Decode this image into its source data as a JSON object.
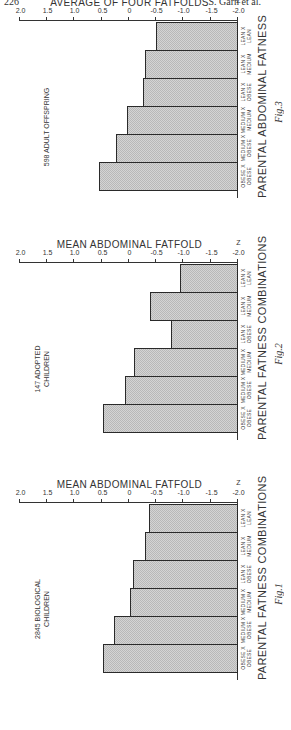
{
  "page": {
    "page_number": "226",
    "running_head": "S. Garn et al."
  },
  "figures": [
    {
      "id": "fig3",
      "caption": "Fig.3",
      "annotation": [
        "598 ADULT OFFSPRING"
      ],
      "y_title": "AVERAGE OF FOUR FATFOLDS",
      "x_title": "PARENTAL ABDOMINAL FATNESS",
      "z_mark": "̅Z"
    },
    {
      "id": "fig2",
      "caption": "Fig.2",
      "annotation": [
        "147 ADOPTED",
        "CHILDREN"
      ],
      "y_title": "MEAN ABDOMINAL FATFOLD",
      "x_title": "PARENTAL FATNESS COMBINATIONS",
      "z_mark": "Z"
    },
    {
      "id": "fig1",
      "caption": "Fig.1",
      "annotation": [
        "2845 BIOLOGICAL",
        "CHILDREN"
      ],
      "y_title": "MEAN ABDOMINAL FATFOLD",
      "x_title": "PARENTAL FATNESS COMBINATIONS",
      "z_mark": "Z"
    }
  ],
  "chart_data": [
    {
      "type": "bar",
      "title": "Fig.3 — 598 ADULT OFFSPRING",
      "orientation": "rotated 90° clockwise on page (bars extend from -2.0 baseline)",
      "categories": [
        "LEAN X LEAN",
        "LEAN X MEDIUM",
        "LEAN X OBESE",
        "MEDIUM X MEDIUM",
        "MEDIUM X OBESE",
        "OBESE X OBESE"
      ],
      "values": [
        -0.5,
        -0.3,
        -0.26,
        0.04,
        0.24,
        0.55
      ],
      "xlabel": "PARENTAL ABDOMINAL FATNESS",
      "ylabel": "AVERAGE OF FOUR FATFOLDS (Z)",
      "ylim": [
        -2.0,
        2.0
      ],
      "yticks": [
        "-2.0",
        "-1.5",
        "-1.0",
        "-0.5",
        "0",
        "0.5",
        "1.0",
        "1.5",
        "2.0"
      ],
      "grid": false,
      "legend": null
    },
    {
      "type": "bar",
      "title": "Fig.2 — 147 ADOPTED CHILDREN",
      "orientation": "rotated 90° clockwise on page (bars extend from -2.0 baseline)",
      "categories": [
        "LEAN X LEAN",
        "LEAN X MEDIUM",
        "LEAN X OBESE",
        "MEDIUM X MEDIUM",
        "MEDIUM X OBESE",
        "OBESE X OBESE"
      ],
      "values": [
        -0.93,
        -0.39,
        -0.77,
        -0.09,
        0.07,
        0.48
      ],
      "xlabel": "PARENTAL FATNESS COMBINATIONS",
      "ylabel": "MEAN ABDOMINAL FATFOLD (Z)",
      "ylim": [
        -2.0,
        2.0
      ],
      "yticks": [
        "-2.0",
        "-1.5",
        "-1.0",
        "-0.5",
        "0",
        "0.5",
        "1.0",
        "1.5",
        "2.0"
      ],
      "grid": false,
      "legend": null
    },
    {
      "type": "bar",
      "title": "Fig.1 — 2845 BIOLOGICAL CHILDREN",
      "orientation": "rotated 90° clockwise on page (bars extend from -2.0 baseline)",
      "categories": [
        "LEAN X LEAN",
        "LEAN X MEDIUM",
        "LEAN X OBESE",
        "MEDIUM X MEDIUM",
        "MEDIUM X OBESE",
        "OBESE X OBESE"
      ],
      "values": [
        -0.36,
        -0.3,
        -0.08,
        -0.02,
        0.27,
        0.48
      ],
      "xlabel": "PARENTAL FATNESS COMBINATIONS",
      "ylabel": "MEAN ABDOMINAL FATFOLD (Z)",
      "ylim": [
        -2.0,
        2.0
      ],
      "yticks": [
        "-2.0",
        "-1.5",
        "-1.0",
        "-0.5",
        "0",
        "0.5",
        "1.0",
        "1.5",
        "2.0"
      ],
      "grid": false,
      "legend": null
    }
  ],
  "category_labels": [
    [
      "LEAN X",
      "LEAN"
    ],
    [
      "LEAN X",
      "MEDIUM"
    ],
    [
      "LEAN X",
      "OBESE"
    ],
    [
      "MEDIUM X",
      "MEDIUM"
    ],
    [
      "MEDIUM X",
      "OBESE"
    ],
    [
      "OBESE X",
      "OBESE"
    ]
  ]
}
